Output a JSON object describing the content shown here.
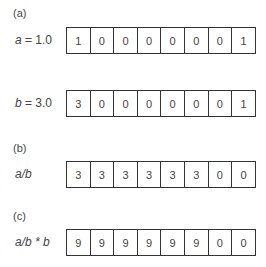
{
  "parts": {
    "a": {
      "label": "(a)",
      "rows": [
        {
          "var": "a",
          "rest": " = 1.0",
          "cells": [
            "1",
            "0",
            "0",
            "0",
            "0",
            "0",
            "0",
            "1"
          ]
        },
        {
          "var": "b",
          "rest": " = 3.0",
          "cells": [
            "3",
            "0",
            "0",
            "0",
            "0",
            "0",
            "0",
            "1"
          ]
        }
      ]
    },
    "b": {
      "label": "(b)",
      "rows": [
        {
          "expr": "a/b",
          "cells": [
            "3",
            "3",
            "3",
            "3",
            "3",
            "3",
            "0",
            "0"
          ]
        }
      ]
    },
    "c": {
      "label": "(c)",
      "rows": [
        {
          "expr": "a/b * b",
          "cells": [
            "9",
            "9",
            "9",
            "9",
            "9",
            "9",
            "0",
            "0"
          ]
        }
      ]
    }
  }
}
